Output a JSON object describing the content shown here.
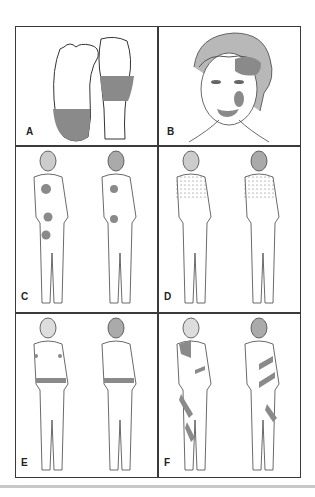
{
  "figure": {
    "panels": [
      {
        "id": "A",
        "label": "A",
        "description": "Plantar view of feet: left sole shaded at heel; right foot shaded midfoot band"
      },
      {
        "id": "B",
        "label": "B",
        "description": "Face with shaded patches on right forehead/temple, cheek and lip"
      },
      {
        "id": "C",
        "label": "C",
        "description": "Front and back body views with round shaded patches on chest, abdomen, pelvis and back"
      },
      {
        "id": "D",
        "label": "D",
        "description": "Front and back body views with speckled pattern over upper trunk, shoulders and arms"
      },
      {
        "id": "E",
        "label": "E",
        "description": "Front and back body views with horizontal shaded band around waist and small axillary patches"
      },
      {
        "id": "F",
        "label": "F",
        "description": "Front and back body views with diagonal shaded stripes across shoulder, trunk and legs"
      }
    ],
    "colors": {
      "shade": "#8a8a8a",
      "line": "#3a3a3a",
      "background": "#ffffff",
      "rule": "#c8c8c8"
    }
  }
}
